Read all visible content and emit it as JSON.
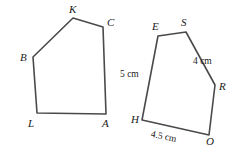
{
  "figure": {
    "background_color": "#ffffff",
    "stroke_color": "#4a4a4a",
    "text_color": "#1a1a1a",
    "shapes": [
      {
        "name": "pentagon-bkcal",
        "vertices": [
          {
            "label": "B",
            "x": 33,
            "y": 57
          },
          {
            "label": "K",
            "x": 73,
            "y": 18
          },
          {
            "label": "C",
            "x": 103,
            "y": 27
          },
          {
            "label": "A",
            "x": 106,
            "y": 114
          },
          {
            "label": "L",
            "x": 37,
            "y": 113
          }
        ],
        "side_labels": []
      },
      {
        "name": "pentagon-eshro",
        "vertices": [
          {
            "label": "E",
            "x": 158,
            "y": 36
          },
          {
            "label": "S",
            "x": 186,
            "y": 32
          },
          {
            "label": "R",
            "x": 215,
            "y": 85
          },
          {
            "label": "O",
            "x": 209,
            "y": 135
          },
          {
            "label": "H",
            "x": 142,
            "y": 120
          }
        ],
        "side_labels": [
          {
            "text": "4 cm",
            "side": "S-R"
          },
          {
            "text": "5 cm",
            "side": "H-E"
          },
          {
            "text": "4.5 cm",
            "side": "H-O"
          }
        ]
      }
    ],
    "vertex_labels": {
      "left": {
        "B": "B",
        "K": "K",
        "C": "C",
        "A": "A",
        "L": "L"
      },
      "right": {
        "E": "E",
        "S": "S",
        "R": "R",
        "O": "O",
        "H": "H"
      }
    },
    "measurements": {
      "sr_side": "4 cm",
      "he_side": "5 cm",
      "ho_side": "4.5 cm"
    }
  }
}
